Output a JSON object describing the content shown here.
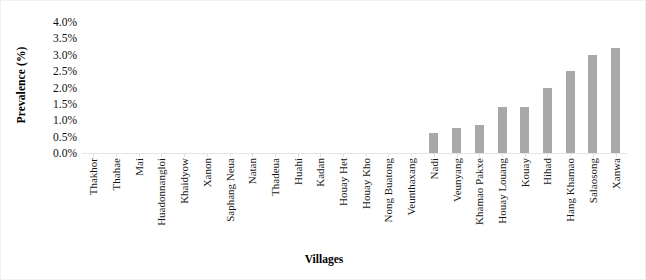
{
  "chart_data": {
    "type": "bar",
    "title": "",
    "xlabel": "Villages",
    "ylabel": "Prevalence (%)",
    "ylim": [
      0,
      4.0
    ],
    "ytick_labels": [
      "4.0%",
      "3.5%",
      "3.0%",
      "2.5%",
      "2.0%",
      "1.5%",
      "1.0%",
      "0.5%",
      "0.0%"
    ],
    "ytick_values": [
      4.0,
      3.5,
      3.0,
      2.5,
      2.0,
      1.5,
      1.0,
      0.5,
      0.0
    ],
    "grid": false,
    "legend": null,
    "bar_color": "#a8a8a8",
    "categories": [
      "Thakhor",
      "Thahae",
      "Mai",
      "Huadonnangloi",
      "Khaidyow",
      "Xanon",
      "Saphang Neua",
      "Natan",
      "Thadeua",
      "Huahi",
      "Kadan",
      "Houay Het",
      "Houay Kho",
      "Nong Buatong",
      "Veunthaxang",
      "Nadi",
      "Veunyang",
      "Khamao Pakxe",
      "Houay Louang",
      "Kouay",
      "Hihad",
      "Hang Khamao",
      "Salaosong",
      "Xanwa"
    ],
    "values": [
      0,
      0,
      0,
      0,
      0,
      0,
      0,
      0,
      0,
      0,
      0,
      0,
      0,
      0,
      0,
      0.6,
      0.75,
      0.85,
      1.4,
      1.4,
      2.0,
      2.5,
      3.0,
      3.2
    ]
  }
}
